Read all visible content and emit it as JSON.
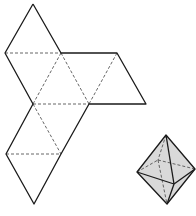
{
  "diagram": {
    "title": "",
    "colors": {
      "solid_edge": "#1a1a1a",
      "fold_line": "#555555",
      "solid_fill": "#d9d9d9",
      "background": "#ffffff"
    },
    "net": {
      "vertices": {
        "A": [
          33,
          4
        ],
        "B": [
          5,
          53
        ],
        "C": [
          61,
          53
        ],
        "D": [
          117,
          53
        ],
        "E": [
          33,
          104
        ],
        "F": [
          89,
          104
        ],
        "G": [
          146,
          104
        ],
        "H": [
          6,
          154
        ],
        "I": [
          61,
          154
        ],
        "J": [
          34,
          204
        ]
      },
      "cut_edges": [
        [
          "A",
          "B"
        ],
        [
          "A",
          "C"
        ],
        [
          "C",
          "D"
        ],
        [
          "D",
          "G"
        ],
        [
          "F",
          "G"
        ],
        [
          "B",
          "E"
        ],
        [
          "E",
          "H"
        ],
        [
          "H",
          "J"
        ],
        [
          "J",
          "I"
        ],
        [
          "I",
          "F"
        ]
      ],
      "fold_lines": [
        [
          "B",
          "C"
        ],
        [
          "C",
          "E"
        ],
        [
          "C",
          "F"
        ],
        [
          "D",
          "F"
        ],
        [
          "E",
          "F"
        ],
        [
          "E",
          "I"
        ],
        [
          "H",
          "I"
        ]
      ]
    },
    "octahedron": {
      "vertices": {
        "top": [
          166,
          135
        ],
        "left": [
          137,
          172
        ],
        "right": [
          195,
          169
        ],
        "bottom": [
          167,
          204
        ],
        "front": [
          174,
          184
        ],
        "back": [
          158,
          160
        ]
      },
      "visible_edges": [
        [
          "top",
          "left"
        ],
        [
          "top",
          "right"
        ],
        [
          "top",
          "front"
        ],
        [
          "left",
          "front"
        ],
        [
          "front",
          "right"
        ],
        [
          "left",
          "bottom"
        ],
        [
          "bottom",
          "right"
        ],
        [
          "front",
          "bottom"
        ]
      ],
      "hidden_edges": [
        [
          "top",
          "back"
        ],
        [
          "left",
          "back"
        ],
        [
          "back",
          "right"
        ],
        [
          "back",
          "bottom"
        ]
      ]
    }
  }
}
